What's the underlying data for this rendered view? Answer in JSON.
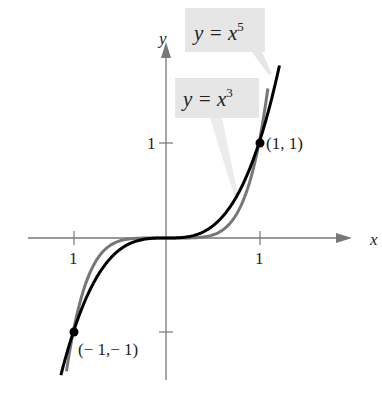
{
  "chart_data": {
    "type": "line",
    "title": "",
    "xlabel": "x",
    "ylabel": "y",
    "xlim": [
      -1.0,
      1.0
    ],
    "ylim": [
      -1.4,
      1.8
    ],
    "grid": false,
    "x_ticks": [
      {
        "value": -1,
        "label": "1"
      },
      {
        "value": 1,
        "label": "1"
      }
    ],
    "y_ticks": [
      {
        "value": 1,
        "label": "1"
      },
      {
        "value": -1,
        "label": ""
      }
    ],
    "series": [
      {
        "name": "y = x^3",
        "label_main": "y = x",
        "label_exp": "3",
        "color": "#000000",
        "x": [
          -1.0,
          -0.75,
          -0.5,
          -0.25,
          0,
          0.25,
          0.5,
          0.75,
          1.0,
          1.1
        ],
        "y": [
          -1.0,
          -0.42,
          -0.125,
          -0.016,
          0,
          0.016,
          0.125,
          0.42,
          1.0,
          1.33
        ]
      },
      {
        "name": "y = x^5",
        "label_main": "y = x",
        "label_exp": "5",
        "color": "#777777",
        "x": [
          -1.0,
          -0.75,
          -0.5,
          -0.25,
          0,
          0.25,
          0.5,
          0.75,
          1.0,
          1.06
        ],
        "y": [
          -1.0,
          -0.24,
          -0.031,
          -0.001,
          0,
          0.001,
          0.031,
          0.24,
          1.0,
          1.34
        ]
      }
    ],
    "annotations": [
      {
        "text": "(1,  1)",
        "x": 1,
        "y": 1
      },
      {
        "text": "(− 1,− 1)",
        "x": -1,
        "y": -1
      }
    ]
  },
  "labels": {
    "x_axis": "x",
    "y_axis": "y",
    "x_tick_neg": "1",
    "x_tick_pos": "1",
    "y_tick_pos": "1",
    "point_pos": "(1,  1)",
    "point_neg": "(− 1,− 1)",
    "curve5_main": "y = x",
    "curve5_exp": "5",
    "curve3_main": "y = x",
    "curve3_exp": "3"
  }
}
